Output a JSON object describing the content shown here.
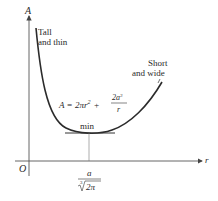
{
  "diagram": {
    "y_axis_label": "A",
    "x_axis_label": "r",
    "origin_label": "O",
    "left_annotation": [
      "Tall",
      "and thin"
    ],
    "right_annotation": [
      "Short",
      "and wide"
    ],
    "formula": {
      "lhs": "A = 2πr",
      "exp": "2",
      "plus": "+",
      "frac_num": "2a",
      "frac_num_exp": "3",
      "frac_den": "r"
    },
    "min_label": "min",
    "min_x_label": {
      "num": "a",
      "den_root_index": "3",
      "den": "2π"
    },
    "colors": {
      "curve": "#2b2b2b",
      "axis": "#444444",
      "text": "#2a2a2a"
    }
  }
}
